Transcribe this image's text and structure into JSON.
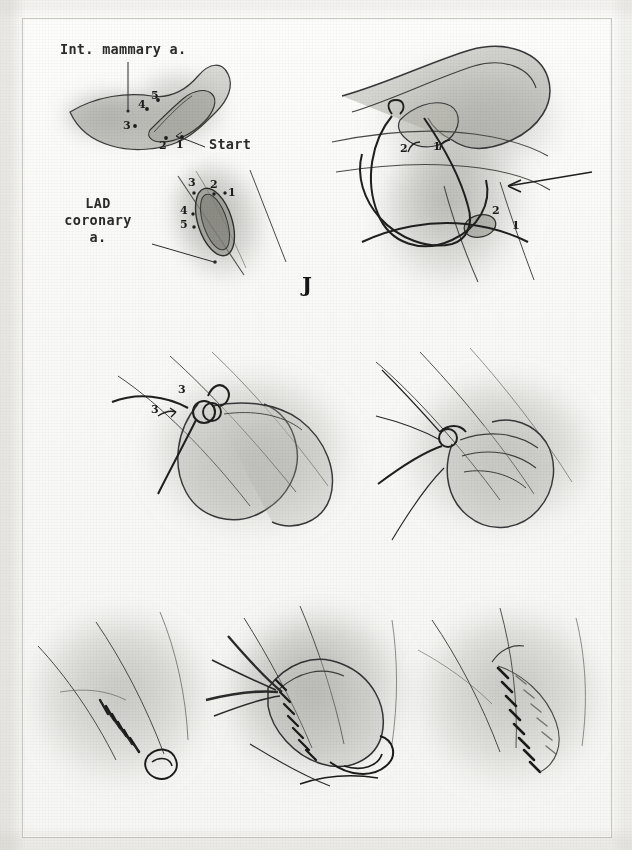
{
  "plate": {
    "letter": "J",
    "title": "Internal mammary artery to LAD coronary artery anastomosis",
    "medium": "graphite pencil drawing on paper",
    "background_color": "#f8f8f6",
    "ink_color": "#2a2a2a"
  },
  "labels": {
    "int_mammary": "Int. mammary a.",
    "start": "Start",
    "lad_line1": "LAD",
    "lad_line2": "coronary",
    "lad_line3": "a."
  },
  "panels": [
    {
      "id": "panel-1-ima-stitch-order",
      "position": "top-left",
      "caption": "Internal mammary artery heel, bite sequence",
      "callouts": [
        "Int. mammary a.",
        "Start"
      ],
      "suture_numbers": [
        "1",
        "2",
        "3",
        "4",
        "5"
      ]
    },
    {
      "id": "panel-2-lad-arteriotomy",
      "position": "upper-left-lower",
      "caption": "LAD coronary arteriotomy, bite sequence",
      "callouts": [
        "LAD",
        "coronary",
        "a."
      ],
      "suture_numbers": [
        "1",
        "2",
        "3",
        "4",
        "5"
      ]
    },
    {
      "id": "panel-3-parachute-sutures",
      "position": "top-right",
      "caption": "Parachute sutures placed, arrow indicates coronary",
      "suture_numbers": [
        "1",
        "2",
        "1",
        "2"
      ],
      "has_arrow": true
    },
    {
      "id": "panel-4-third-stitch",
      "position": "middle-left",
      "caption": "Third suture passed and drawn down",
      "suture_numbers": [
        "3",
        "3"
      ]
    },
    {
      "id": "panel-5-graft-seated",
      "position": "middle-right",
      "caption": "Graft parachuted down onto the arteriotomy",
      "suture_numbers": []
    },
    {
      "id": "panel-6-near-side-complete",
      "position": "bottom-left",
      "caption": "Near side running suture completed and tied",
      "suture_numbers": []
    },
    {
      "id": "panel-7-running-closure",
      "position": "bottom-center",
      "caption": "Running closure of the anastomosis with forceps traction",
      "suture_numbers": []
    },
    {
      "id": "panel-8-finished-anastomosis",
      "position": "bottom-right",
      "caption": "Completed internal mammary to LAD anastomosis",
      "suture_numbers": []
    }
  ],
  "dot_markers": {
    "ima": [
      {
        "n": "1",
        "x": 176,
        "y": 143
      },
      {
        "n": "2",
        "x": 161,
        "y": 144
      },
      {
        "n": "3",
        "x": 127,
        "y": 125
      },
      {
        "n": "4",
        "x": 141,
        "y": 104
      },
      {
        "n": "5",
        "x": 153,
        "y": 96
      }
    ],
    "lad": [
      {
        "n": "1",
        "x": 223,
        "y": 199
      },
      {
        "n": "2",
        "x": 211,
        "y": 187
      },
      {
        "n": "3",
        "x": 189,
        "y": 184
      },
      {
        "n": "4",
        "x": 184,
        "y": 208
      },
      {
        "n": "5",
        "x": 184,
        "y": 222
      }
    ],
    "panel3_upper": [
      {
        "n": "2",
        "x": 405,
        "y": 148
      },
      {
        "n": "1",
        "x": 437,
        "y": 146
      }
    ],
    "panel3_lower": [
      {
        "n": "2",
        "x": 496,
        "y": 210
      },
      {
        "n": "1",
        "x": 515,
        "y": 225
      }
    ],
    "panel4": [
      {
        "n": "3",
        "x": 182,
        "y": 391
      },
      {
        "n": "3",
        "x": 155,
        "y": 411
      }
    ]
  }
}
